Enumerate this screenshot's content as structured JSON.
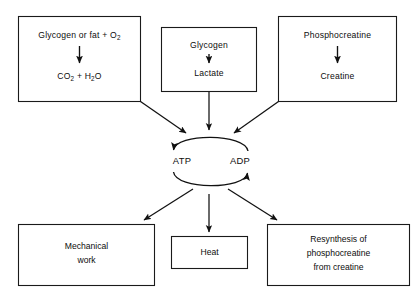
{
  "diagram": {
    "colors": {
      "background": "#ffffff",
      "line": "#111111",
      "box_stroke": "#1a1a1a",
      "text": "#0d0d0d"
    },
    "sources": [
      {
        "id": "aerobic",
        "reactant": "Glycogen or fat + O",
        "reactant_sub": "2",
        "product_a": "CO",
        "product_a_sub": "2",
        "product_join": " + H",
        "product_b_sub": "2",
        "product_tail": "O"
      },
      {
        "id": "glycolytic",
        "reactant": "Glycogen",
        "product": "Lactate"
      },
      {
        "id": "phosphagen",
        "reactant": "Phosphocreatine",
        "product": "Creatine"
      }
    ],
    "cycle": {
      "left_label": "ATP",
      "right_label": "ADP"
    },
    "sinks": [
      {
        "id": "mechanical-work",
        "line1": "Mechanical",
        "line2": "work"
      },
      {
        "id": "heat",
        "line1": "Heat"
      },
      {
        "id": "resynthesis",
        "line1": "Resynthesis of",
        "line2": "phosphocreatine",
        "line3": "from creatine"
      }
    ]
  }
}
